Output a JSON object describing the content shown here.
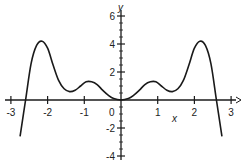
{
  "chart_data": {
    "type": "line",
    "title": "",
    "xlabel": "x",
    "ylabel": "y",
    "xlim": [
      -3,
      3
    ],
    "ylim": [
      -4,
      6
    ],
    "grid": false,
    "legend": null,
    "x_ticks": [
      "-3",
      "-2",
      "-1",
      "0",
      "1",
      "2",
      "3"
    ],
    "y_ticks": [
      "6",
      "4",
      "2",
      "-2",
      "-4"
    ],
    "series": [
      {
        "name": "f(x)",
        "x": [
          -2.75,
          -2.6,
          -2.45,
          -2.3,
          -2.15,
          -2.0,
          -1.85,
          -1.7,
          -1.55,
          -1.4,
          -1.25,
          -1.1,
          -0.95,
          -0.8,
          -0.65,
          -0.5,
          -0.35,
          -0.2,
          0.0,
          0.2,
          0.35,
          0.5,
          0.65,
          0.8,
          0.95,
          1.1,
          1.25,
          1.4,
          1.55,
          1.7,
          1.85,
          2.0,
          2.15,
          2.3,
          2.45,
          2.6,
          2.75
        ],
        "y": [
          -2.6,
          0.0,
          2.6,
          3.9,
          4.2,
          3.7,
          2.5,
          1.4,
          0.8,
          0.6,
          0.7,
          1.0,
          1.3,
          1.3,
          1.1,
          0.7,
          0.35,
          0.1,
          0.0,
          0.1,
          0.35,
          0.7,
          1.1,
          1.3,
          1.3,
          1.0,
          0.7,
          0.6,
          0.8,
          1.4,
          2.5,
          3.7,
          4.2,
          3.9,
          2.6,
          0.0,
          -2.6
        ]
      }
    ]
  },
  "labels": {
    "x_axis": "x",
    "y_axis": "y",
    "origin": "0"
  },
  "colors": {
    "curve": "#1a1a1a",
    "axis": "#1a1a1a"
  }
}
